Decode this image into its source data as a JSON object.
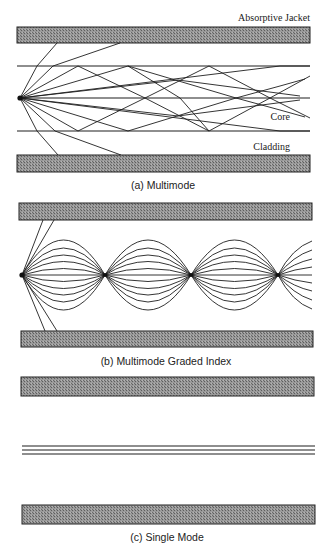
{
  "figure": {
    "panels": [
      {
        "id": "a",
        "caption": "(a) Multimode",
        "labels": {
          "jacket": "Absorptive Jacket",
          "core": "Core",
          "cladding": "Cladding"
        }
      },
      {
        "id": "b",
        "caption": "(b) Multimode Graded Index"
      },
      {
        "id": "c",
        "caption": "(c) Single Mode"
      }
    ]
  },
  "colors": {
    "line": "#1e1e1e",
    "jacket_fill": "#8a8a8a",
    "background": "#ffffff"
  }
}
